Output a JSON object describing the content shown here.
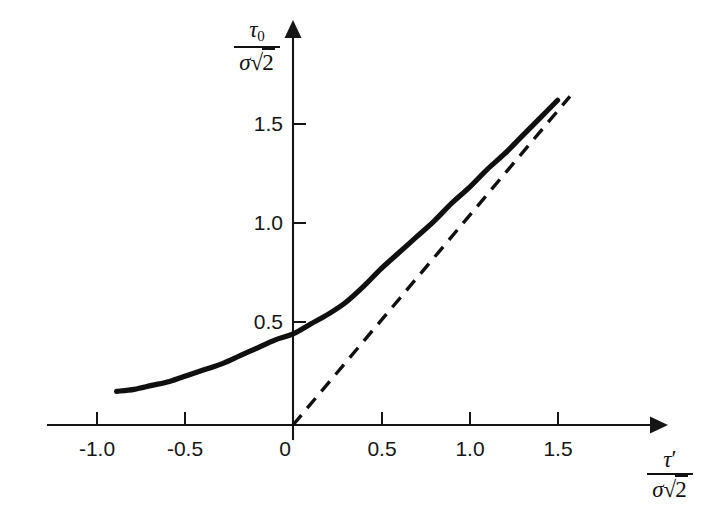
{
  "figure": {
    "name": "tau0-vs-tau-prime-plot",
    "background_color": "#ffffff",
    "ink_color": "#101010"
  },
  "axes": {
    "y_axis": {
      "name": "y-axis",
      "label_numerator": "τ",
      "label_numerator_sub": "0",
      "label_denominator_sigma": "σ",
      "label_denominator_root": "√",
      "label_denominator_arg": "2",
      "label_plain": "τ0 / σ√2",
      "ticks": [
        "0.5",
        "1.0",
        "1.5"
      ],
      "tick_values": [
        0.5,
        1.0,
        1.5
      ],
      "range": [
        -0.1,
        1.8
      ],
      "arrow": "up-arrow-icon"
    },
    "x_axis": {
      "name": "x-axis",
      "label_numerator": "τ",
      "label_numerator_prime": "′",
      "label_denominator_sigma": "σ",
      "label_denominator_root": "√",
      "label_denominator_arg": "2",
      "label_plain": "τ′ / σ√2",
      "ticks": [
        "-1.0",
        "-0.5",
        "0",
        "0.5",
        "1.0",
        "1.5"
      ],
      "tick_values": [
        -1.0,
        -0.5,
        0,
        0.5,
        1.0,
        1.5
      ],
      "range": [
        -1.25,
        1.95
      ],
      "arrow": "right-arrow-icon"
    },
    "grid": false,
    "legend": "none"
  },
  "chart_data": {
    "type": "line",
    "title": "",
    "subtitle": "",
    "xlabel": "τ′ / σ√2",
    "ylabel": "τ0 / σ√2",
    "xlim": [
      -1.25,
      1.95
    ],
    "ylim": [
      -0.1,
      1.8
    ],
    "grid": false,
    "legend_position": "none",
    "xticks": [
      -1.0,
      -0.5,
      0,
      0.5,
      1.0,
      1.5
    ],
    "xticklabels": [
      "-1.0",
      "-0.5",
      "0",
      "0.5",
      "1.0",
      "1.5"
    ],
    "yticks": [
      0.5,
      1.0,
      1.5
    ],
    "yticklabels": [
      "0.5",
      "1.0",
      "1.5"
    ],
    "series": [
      {
        "name": "tau0-curve",
        "style": "solid",
        "linewidth": 5.2,
        "color": "#101010",
        "x": [
          -1.0,
          -0.9,
          -0.8,
          -0.7,
          -0.6,
          -0.5,
          -0.4,
          -0.3,
          -0.2,
          -0.1,
          0.0,
          0.1,
          0.2,
          0.3,
          0.4,
          0.5,
          0.6,
          0.7,
          0.8,
          0.9,
          1.0,
          1.1,
          1.2,
          1.3,
          1.4,
          1.5
        ],
        "values": [
          0.17,
          0.18,
          0.2,
          0.22,
          0.25,
          0.28,
          0.31,
          0.35,
          0.39,
          0.43,
          0.46,
          0.51,
          0.56,
          0.62,
          0.7,
          0.79,
          0.87,
          0.95,
          1.03,
          1.12,
          1.2,
          1.29,
          1.37,
          1.46,
          1.55,
          1.64
        ]
      },
      {
        "name": "asymptote-line",
        "style": "dashed",
        "linewidth": 3.4,
        "color": "#101010",
        "x": [
          0.0,
          1.57
        ],
        "values": [
          0.0,
          1.66
        ]
      }
    ],
    "annotations": []
  }
}
